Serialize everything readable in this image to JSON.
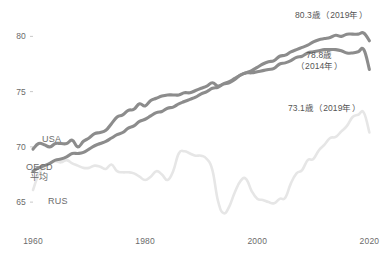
{
  "chart_data": {
    "type": "line",
    "title": "",
    "xlabel": "",
    "ylabel": "",
    "xlim": [
      1960,
      2021
    ],
    "ylim": [
      63.2,
      81.3
    ],
    "grid": false,
    "legend_position": "inline-labels",
    "x_ticks": [
      "1960",
      "1980",
      "2000",
      "2020"
    ],
    "x_tick_values": [
      1960,
      1980,
      2000,
      2020
    ],
    "y_ticks": [
      "80",
      "75",
      "70",
      "65"
    ],
    "y_tick_values": [
      80,
      75,
      70,
      65
    ],
    "series": [
      {
        "name": "USA",
        "color": "#8c8c8c",
        "x": [
          1960,
          1961,
          1962,
          1963,
          1964,
          1965,
          1966,
          1967,
          1968,
          1969,
          1970,
          1971,
          1972,
          1973,
          1974,
          1975,
          1976,
          1977,
          1978,
          1979,
          1980,
          1981,
          1982,
          1983,
          1984,
          1985,
          1986,
          1987,
          1988,
          1989,
          1990,
          1991,
          1992,
          1993,
          1994,
          1995,
          1996,
          1997,
          1998,
          1999,
          2000,
          2001,
          2002,
          2003,
          2004,
          2005,
          2006,
          2007,
          2008,
          2009,
          2010,
          2011,
          2012,
          2013,
          2014,
          2015,
          2016,
          2017,
          2018,
          2019,
          2020
        ],
        "values": [
          69.8,
          70.3,
          70.2,
          70.0,
          70.3,
          70.3,
          70.3,
          70.6,
          70.0,
          70.5,
          70.8,
          71.2,
          71.3,
          71.5,
          72.1,
          72.7,
          72.9,
          73.3,
          73.4,
          73.9,
          73.7,
          74.2,
          74.4,
          74.6,
          74.7,
          74.7,
          74.7,
          74.9,
          74.9,
          75.1,
          75.3,
          75.5,
          75.8,
          75.5,
          75.7,
          75.8,
          76.1,
          76.5,
          76.7,
          76.7,
          76.8,
          76.9,
          77.0,
          77.1,
          77.5,
          77.6,
          77.8,
          78.1,
          78.2,
          78.5,
          78.6,
          78.7,
          78.8,
          78.8,
          78.8,
          78.7,
          78.5,
          78.5,
          78.6,
          78.8,
          77.0
        ],
        "endpoint_label": "78.8歳",
        "endpoint_label_year": "（2014年）"
      },
      {
        "name": "OECD平均",
        "color": "#8c8c8c",
        "x": [
          1960,
          1961,
          1962,
          1963,
          1964,
          1965,
          1966,
          1967,
          1968,
          1969,
          1970,
          1971,
          1972,
          1973,
          1974,
          1975,
          1976,
          1977,
          1978,
          1979,
          1980,
          1981,
          1982,
          1983,
          1984,
          1985,
          1986,
          1987,
          1988,
          1989,
          1990,
          1991,
          1992,
          1993,
          1994,
          1995,
          1996,
          1997,
          1998,
          1999,
          2000,
          2001,
          2002,
          2003,
          2004,
          2005,
          2006,
          2007,
          2008,
          2009,
          2010,
          2011,
          2012,
          2013,
          2014,
          2015,
          2016,
          2017,
          2018,
          2019,
          2020
        ],
        "values": [
          67.8,
          68.1,
          68.3,
          68.5,
          68.8,
          68.9,
          69.1,
          69.4,
          69.4,
          69.5,
          69.8,
          70.1,
          70.3,
          70.5,
          70.8,
          71.1,
          71.3,
          71.7,
          71.9,
          72.3,
          72.5,
          72.8,
          73.1,
          73.2,
          73.5,
          73.6,
          73.9,
          74.1,
          74.3,
          74.5,
          74.8,
          75.0,
          75.3,
          75.4,
          75.7,
          75.9,
          76.2,
          76.5,
          76.7,
          76.9,
          77.2,
          77.5,
          77.7,
          77.8,
          78.2,
          78.3,
          78.6,
          78.8,
          79.0,
          79.2,
          79.5,
          79.7,
          79.8,
          79.9,
          80.1,
          80.0,
          80.2,
          80.2,
          80.2,
          80.3,
          79.6
        ],
        "endpoint_label": "80.3歳",
        "endpoint_label_year": "(2019年)"
      },
      {
        "name": "RUS",
        "color": "#e6e6e6",
        "x": [
          1960,
          1961,
          1962,
          1963,
          1964,
          1965,
          1966,
          1967,
          1968,
          1969,
          1970,
          1971,
          1972,
          1973,
          1974,
          1975,
          1976,
          1977,
          1978,
          1979,
          1980,
          1981,
          1982,
          1983,
          1984,
          1985,
          1986,
          1987,
          1988,
          1989,
          1990,
          1991,
          1992,
          1993,
          1994,
          1995,
          1996,
          1997,
          1998,
          1999,
          2000,
          2001,
          2002,
          2003,
          2004,
          2005,
          2006,
          2007,
          2008,
          2009,
          2010,
          2011,
          2012,
          2013,
          2014,
          2015,
          2016,
          2017,
          2018,
          2019,
          2020
        ],
        "values": [
          66.1,
          67.5,
          68.2,
          68.5,
          68.7,
          68.6,
          68.8,
          68.5,
          68.3,
          68.1,
          68.1,
          68.3,
          68.2,
          68.0,
          68.4,
          67.8,
          67.7,
          67.7,
          67.6,
          67.3,
          67.0,
          67.3,
          67.8,
          67.5,
          67.0,
          67.8,
          69.4,
          69.6,
          69.4,
          69.2,
          69.2,
          68.9,
          67.9,
          65.1,
          64.0,
          64.6,
          65.9,
          66.9,
          67.1,
          66.0,
          65.3,
          65.2,
          65.0,
          64.9,
          65.3,
          65.4,
          66.7,
          67.6,
          67.9,
          68.8,
          68.9,
          69.7,
          70.2,
          70.8,
          70.9,
          71.4,
          71.9,
          72.7,
          72.9,
          73.1,
          71.3
        ],
        "endpoint_label": "73.1歳",
        "endpoint_label_year": "(2019年)"
      }
    ],
    "annotations": [
      {
        "id": "ann-oecd",
        "text_line1": "80.3歳（2019年）",
        "text_line2": "",
        "series": "OECD平均"
      },
      {
        "id": "ann-usa",
        "text_line1": "78.8歳",
        "text_line2": "（2014年）",
        "series": "USA"
      },
      {
        "id": "ann-rus",
        "text_line1": "73.1歳（2019年）",
        "text_line2": "",
        "series": "RUS"
      }
    ],
    "inline_labels": [
      {
        "id": "label-usa",
        "text_line1": "USA",
        "text_line2": ""
      },
      {
        "id": "label-oecd",
        "text_line1": "OECD",
        "text_line2": "平均"
      },
      {
        "id": "label-rus",
        "text_line1": "RUS",
        "text_line2": ""
      }
    ]
  },
  "style": {
    "line_color_dark": "#8c8c8c",
    "line_color_light": "#e6e6e6",
    "text_color": "#5f5f5f",
    "tick_color": "#c8c8c8",
    "background": "#ffffff"
  }
}
